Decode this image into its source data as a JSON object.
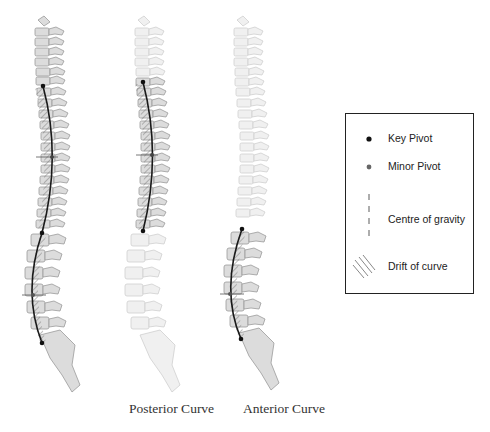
{
  "figure": {
    "type": "spinal curvature diagram",
    "spines": [
      {
        "id": "full",
        "caption": "",
        "highlighted_region": "thoracic and lumbar",
        "key_pivots": [
          [
            43,
            86
          ],
          [
            42,
            233
          ],
          [
            42,
            343
          ]
        ],
        "minor_pivots": [
          [
            52,
            157
          ],
          [
            33,
            295
          ]
        ]
      },
      {
        "id": "posterior",
        "caption": "Posterior Curve",
        "highlighted_region": "thoracic",
        "key_pivots": [
          [
            143,
            82
          ],
          [
            143,
            231
          ]
        ],
        "minor_pivots": [
          [
            152,
            155
          ]
        ]
      },
      {
        "id": "anterior",
        "caption": "Anterior Curve",
        "highlighted_region": "lumbar",
        "key_pivots": [
          [
            242,
            229
          ],
          [
            241,
            339
          ]
        ],
        "minor_pivots": [
          [
            230,
            294
          ]
        ]
      }
    ]
  },
  "captions": {
    "posterior": "Posterior Curve",
    "anterior": "Anterior Curve"
  },
  "legend": {
    "items": [
      {
        "icon": "key-pivot-dot",
        "label": "Key Pivot"
      },
      {
        "icon": "minor-pivot-dot",
        "label": "Minor Pivot"
      },
      {
        "icon": "dashed-line",
        "label": "Centre of gravity"
      },
      {
        "icon": "hatch-pattern",
        "label": "Drift of curve"
      }
    ]
  },
  "colors": {
    "key_pivot": "#111111",
    "minor_pivot": "#666666",
    "bone_fill": "#dcdcdc",
    "bone_faded": "#efefef",
    "bone_stroke": "#9a9a9a",
    "curve_line": "#1a1a1a"
  }
}
